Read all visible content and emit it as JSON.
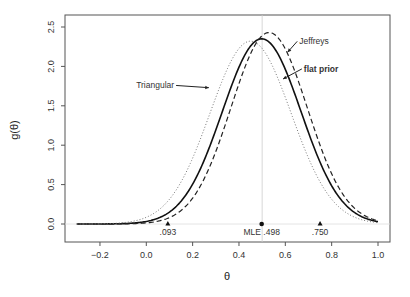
{
  "chart_data": {
    "type": "line",
    "title": "",
    "xlabel": "θ",
    "ylabel": "g(θ)",
    "xlim": [
      -0.3,
      1.0
    ],
    "ylim": [
      0.0,
      2.6
    ],
    "x_ticks": [
      "-0.2",
      "0.0",
      "0.2",
      "0.4",
      "0.6",
      "0.8",
      "1.0"
    ],
    "x_tick_values": [
      -0.2,
      0.0,
      0.2,
      0.4,
      0.6,
      0.8,
      1.0
    ],
    "y_ticks": [
      "0.0",
      "0.5",
      "1.0",
      "1.5",
      "2.0",
      "2.5"
    ],
    "y_tick_values": [
      0.0,
      0.5,
      1.0,
      1.5,
      2.0,
      2.5
    ],
    "grid": false,
    "series": [
      {
        "name": "flat prior",
        "style": "solid",
        "center": 0.498,
        "peak": 2.35,
        "sd": 0.17
      },
      {
        "name": "Jeffreys",
        "style": "dashed",
        "center": 0.53,
        "peak": 2.43,
        "sd": 0.165
      },
      {
        "name": "Triangular",
        "style": "dotted",
        "center": 0.45,
        "peak": 2.32,
        "sd": 0.175
      }
    ],
    "annotations": [
      {
        "text": "Jeffreys",
        "x": 0.66,
        "y": 2.28
      },
      {
        "text": "flat prior",
        "x": 0.68,
        "y": 1.93
      },
      {
        "text": "Triangular",
        "x": 0.12,
        "y": 1.72
      }
    ],
    "markers": [
      {
        "label": ".093",
        "x": 0.093,
        "shape": "triangle"
      },
      {
        "label": "MLE .498",
        "x": 0.498,
        "shape": "circle"
      },
      {
        "label": ".750",
        "x": 0.75,
        "shape": "triangle"
      }
    ],
    "reference_lines": {
      "vertical_at": 0.5,
      "horizontal_at": 0.0
    }
  }
}
